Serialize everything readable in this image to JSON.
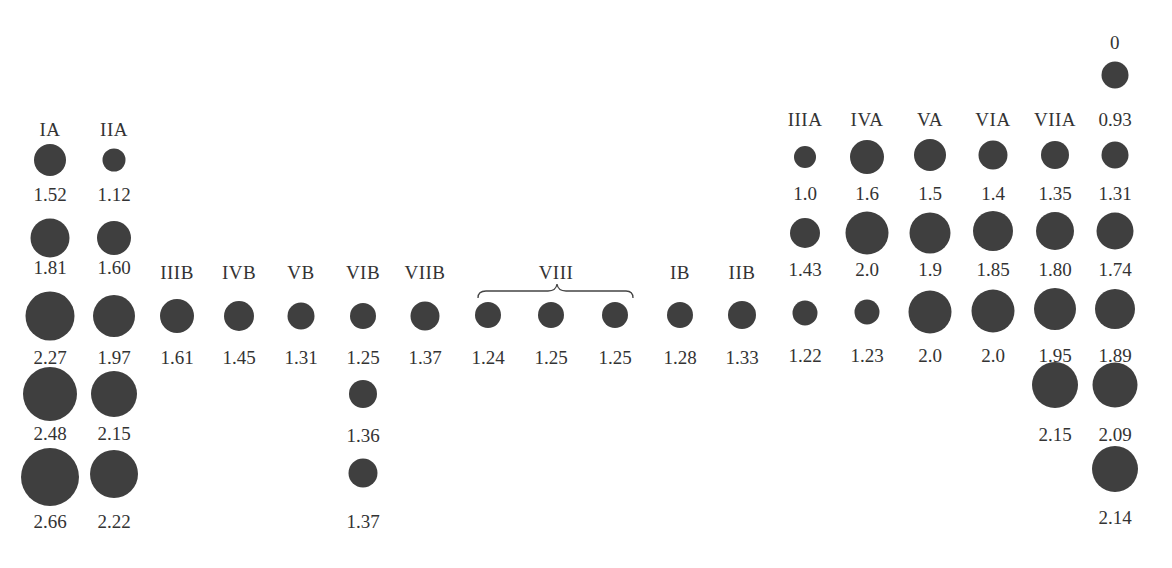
{
  "colors": {
    "atom": "#3f3f3f",
    "text": "#333333",
    "background": "#ffffff"
  },
  "brace_label": "VIII",
  "groups": [
    {
      "name": "IA",
      "values": [
        "1.52",
        "1.81",
        "2.27",
        "2.48",
        "2.66"
      ]
    },
    {
      "name": "IIA",
      "values": [
        "1.12",
        "1.60",
        "1.97",
        "2.15",
        "2.22"
      ]
    },
    {
      "name": "IIIB",
      "values": [
        "1.61"
      ]
    },
    {
      "name": "IVB",
      "values": [
        "1.45"
      ]
    },
    {
      "name": "VB",
      "values": [
        "1.31"
      ]
    },
    {
      "name": "VIB",
      "values": [
        "1.25",
        "1.36",
        "1.37"
      ]
    },
    {
      "name": "VIIB",
      "values": [
        "1.37"
      ]
    },
    {
      "name": "",
      "values": [
        "1.24"
      ]
    },
    {
      "name": "",
      "values": [
        "1.25"
      ]
    },
    {
      "name": "",
      "values": [
        "1.25"
      ]
    },
    {
      "name": "IB",
      "values": [
        "1.28"
      ]
    },
    {
      "name": "IIB",
      "values": [
        "1.33"
      ]
    },
    {
      "name": "IIIA",
      "values": [
        "1.0",
        "1.43",
        "1.22"
      ]
    },
    {
      "name": "IVA",
      "values": [
        "1.6",
        "2.0",
        "1.23"
      ]
    },
    {
      "name": "VA",
      "values": [
        "1.5",
        "1.9",
        "2.0"
      ]
    },
    {
      "name": "VIA",
      "values": [
        "1.4",
        "1.85",
        "2.0"
      ]
    },
    {
      "name": "VIIA",
      "values": [
        "1.35",
        "1.80",
        "1.95",
        "2.15"
      ]
    },
    {
      "name": "0",
      "values": [
        "0.93",
        "1.31",
        "1.74",
        "1.89",
        "2.09",
        "2.14"
      ]
    }
  ]
}
